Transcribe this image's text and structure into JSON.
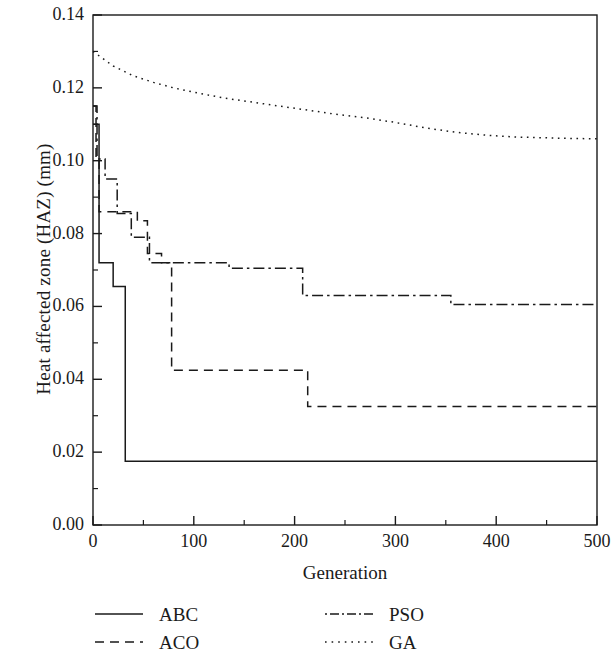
{
  "chart_data": {
    "type": "line",
    "title": "",
    "xlabel": "Generation",
    "ylabel": "Heat affected zone (HAZ) (mm)",
    "xlim": [
      0,
      500
    ],
    "ylim": [
      0.0,
      0.14
    ],
    "xticks": [
      0,
      100,
      200,
      300,
      400,
      500
    ],
    "xtick_labels": [
      "0",
      "100",
      "200",
      "300",
      "400",
      "500"
    ],
    "x_minor_tick_interval": 50,
    "yticks": [
      0.0,
      0.02,
      0.04,
      0.06,
      0.08,
      0.1,
      0.12,
      0.14
    ],
    "ytick_labels": [
      "0.00",
      "0.02",
      "0.04",
      "0.06",
      "0.08",
      "0.10",
      "0.12",
      "0.14"
    ],
    "y_minor_tick_interval": 0.01,
    "grid": false,
    "legend_position": "below-axes",
    "line_color": "#1a1a1a",
    "series": [
      {
        "name": "ABC",
        "style": "solid",
        "dash": "none",
        "points": [
          [
            0,
            0.11
          ],
          [
            6,
            0.11
          ],
          [
            6,
            0.072
          ],
          [
            20,
            0.072
          ],
          [
            20,
            0.0655
          ],
          [
            32,
            0.0655
          ],
          [
            32,
            0.0175
          ],
          [
            500,
            0.0175
          ]
        ]
      },
      {
        "name": "ACO",
        "style": "dashed",
        "dash": "10,7",
        "points": [
          [
            0,
            0.115
          ],
          [
            3,
            0.115
          ],
          [
            3,
            0.1
          ],
          [
            6,
            0.1
          ],
          [
            6,
            0.086
          ],
          [
            44,
            0.086
          ],
          [
            44,
            0.0835
          ],
          [
            54,
            0.0835
          ],
          [
            54,
            0.0745
          ],
          [
            68,
            0.0745
          ],
          [
            68,
            0.072
          ],
          [
            78,
            0.072
          ],
          [
            78,
            0.0425
          ],
          [
            213,
            0.0425
          ],
          [
            213,
            0.0325
          ],
          [
            500,
            0.0325
          ]
        ]
      },
      {
        "name": "PSO",
        "style": "dash-dot",
        "dash": "14,5,3,5",
        "points": [
          [
            0,
            0.115
          ],
          [
            4,
            0.115
          ],
          [
            4,
            0.1005
          ],
          [
            12,
            0.1005
          ],
          [
            12,
            0.095
          ],
          [
            24,
            0.095
          ],
          [
            24,
            0.0855
          ],
          [
            38,
            0.0855
          ],
          [
            38,
            0.079
          ],
          [
            56,
            0.079
          ],
          [
            56,
            0.072
          ],
          [
            135,
            0.072
          ],
          [
            135,
            0.0705
          ],
          [
            208,
            0.0705
          ],
          [
            208,
            0.063
          ],
          [
            355,
            0.063
          ],
          [
            355,
            0.0605
          ],
          [
            500,
            0.0605
          ]
        ]
      },
      {
        "name": "GA",
        "style": "dotted",
        "dash": "2,5",
        "points": [
          [
            0,
            0.13
          ],
          [
            20,
            0.126
          ],
          [
            40,
            0.1233
          ],
          [
            60,
            0.1215
          ],
          [
            80,
            0.12
          ],
          [
            100,
            0.1188
          ],
          [
            130,
            0.1172
          ],
          [
            160,
            0.116
          ],
          [
            190,
            0.1148
          ],
          [
            210,
            0.114
          ],
          [
            240,
            0.1128
          ],
          [
            270,
            0.1118
          ],
          [
            300,
            0.1105
          ],
          [
            330,
            0.109
          ],
          [
            360,
            0.1078
          ],
          [
            390,
            0.107
          ],
          [
            420,
            0.1065
          ],
          [
            460,
            0.1062
          ],
          [
            500,
            0.106
          ]
        ]
      }
    ]
  },
  "legend": {
    "rows": [
      {
        "left": {
          "label": "ABC",
          "key": "solid-line-key"
        },
        "right": {
          "label": "PSO",
          "key": "dash-dot-line-key"
        }
      },
      {
        "left": {
          "label": "ACO",
          "key": "dashed-line-key"
        },
        "right": {
          "label": "GA",
          "key": "dotted-line-key"
        }
      }
    ]
  }
}
